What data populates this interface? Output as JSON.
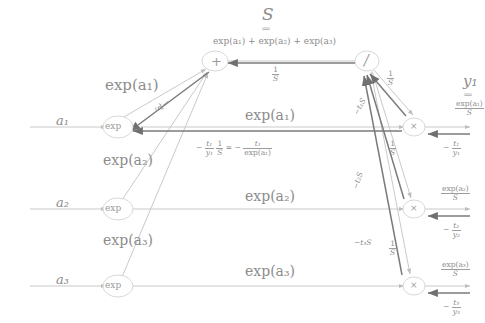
{
  "diagram": {
    "colors": {
      "text": "#8d8d8d",
      "edge_forward": "#b8b8b8",
      "edge_backward": "#7d7d7d",
      "node_stroke": "#cfcfcf",
      "background": "#ffffff"
    },
    "top": {
      "S_symbol": "S",
      "equals": "‖",
      "S_expansion": "exp(a₁) + exp(a₂) + exp(a₃)"
    },
    "nodes": {
      "plus": "+",
      "divide": "/",
      "exp1": "exp",
      "exp2": "exp",
      "exp3": "exp",
      "times1": "×",
      "times2": "×",
      "times3": "×"
    },
    "inputs": [
      {
        "name": "a1",
        "label": "a₁"
      },
      {
        "name": "a2",
        "label": "a₂"
      },
      {
        "name": "a3",
        "label": "a₃"
      }
    ],
    "forward_labels": [
      {
        "name": "exp-a1-upper",
        "label": "exp(a₁)"
      },
      {
        "name": "exp-a1-mid",
        "label": "exp(a₁)"
      },
      {
        "name": "exp-a2-upper",
        "label": "exp(a₂)"
      },
      {
        "name": "exp-a2-mid",
        "label": "exp(a₂)"
      },
      {
        "name": "exp-a3-upper",
        "label": "exp(a₃)"
      },
      {
        "name": "exp-a3-mid",
        "label": "exp(a₃)"
      }
    ],
    "output": {
      "y_symbol": "y₁",
      "equals": "‖",
      "numerator": "exp(a₁)",
      "denominator": "S"
    },
    "outputs_fracs": [
      {
        "name": "y1-value",
        "num": "exp(a₁)",
        "den": "S"
      },
      {
        "name": "y2-value",
        "num": "exp(a₂)",
        "den": "S"
      },
      {
        "name": "y3-value",
        "num": "exp(a₃)",
        "den": "S"
      }
    ],
    "grad_inputs": [
      {
        "name": "grad-y1",
        "sign": "−",
        "num": "t₁",
        "den": "y₁"
      },
      {
        "name": "grad-y2",
        "sign": "−",
        "num": "t₂",
        "den": "y₂"
      },
      {
        "name": "grad-y3",
        "sign": "−",
        "num": "t₃",
        "den": "y₃"
      }
    ],
    "edge_labels": {
      "inv_S": {
        "num": "1",
        "den": "S"
      },
      "sum_to_div": {
        "num": "1",
        "den": "S"
      },
      "backward_identity": {
        "a_sign": "−",
        "a_num": "t₁",
        "a_den": "y₁",
        "b_num": "1",
        "b_den": "S",
        "eq": "=",
        "c_sign": "−",
        "c_num": "t₁",
        "c_den": "exp(a₁)"
      },
      "neg_t1_S": "−t₁S",
      "neg_t2_S": "−t₂S",
      "neg_t3_S": "−t₃S",
      "one_over_S_r1": {
        "num": "1",
        "den": "S"
      },
      "one_over_S_r2": {
        "num": "1",
        "den": "S"
      },
      "one_over_S_r3": {
        "num": "1",
        "den": "S"
      },
      "one_over_S_diag_left": {
        "num": "1",
        "den": "S"
      },
      "one_over_S_diag_right": {
        "num": "1",
        "den": "S"
      }
    }
  }
}
